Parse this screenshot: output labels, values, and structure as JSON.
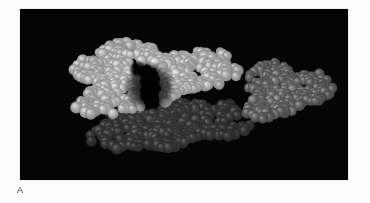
{
  "figure": {
    "panel_label": "A",
    "plate": {
      "background_color": "#050505",
      "x": 20,
      "y": 9,
      "width": 328,
      "height": 171
    },
    "page_background_color": "#ffffff",
    "label_color": "#3a3a3a"
  },
  "chart_data": {
    "type": "scatter",
    "title": "",
    "subtitle": "",
    "xlabel": "",
    "ylabel": "",
    "grid": false,
    "legend_position": "none",
    "render_style": "space-filling-cpk-spheres",
    "background_color": "#050505",
    "xlim": [
      0,
      328
    ],
    "ylim": [
      0,
      171
    ],
    "annotations": [
      "A"
    ],
    "series": [
      {
        "name": "large-complex-upper-lobe",
        "color": "#d8d8d8",
        "highlight_color": "#f2f2f2",
        "shadow_color": "#7a7a7a",
        "sphere_count": 460,
        "sphere_radius": [
          3.2,
          6.2
        ],
        "region": {
          "cx": 125,
          "cy": 68,
          "rx": 92,
          "ry": 40,
          "rotation": -6
        }
      },
      {
        "name": "large-complex-lower-lobe",
        "color": "#4a4a4a",
        "highlight_color": "#707070",
        "shadow_color": "#202020",
        "sphere_count": 420,
        "sphere_radius": [
          3.2,
          6.2
        ],
        "region": {
          "cx": 140,
          "cy": 110,
          "rx": 90,
          "ry": 38,
          "rotation": 3
        }
      },
      {
        "name": "right-molecule",
        "color": "#8c8c8c",
        "highlight_color": "#b4b4b4",
        "shadow_color": "#3c3c3c",
        "sphere_count": 300,
        "sphere_radius": [
          3.0,
          5.6
        ],
        "region": {
          "cx": 263,
          "cy": 82,
          "rx": 50,
          "ry": 32,
          "rotation": -4
        }
      }
    ],
    "features": [
      {
        "name": "central-cleft",
        "cx": 130,
        "cy": 78,
        "rx": 14,
        "ry": 26
      },
      {
        "name": "inter-lobe-gap",
        "cx": 118,
        "cy": 60,
        "rx": 9,
        "ry": 9
      }
    ]
  }
}
